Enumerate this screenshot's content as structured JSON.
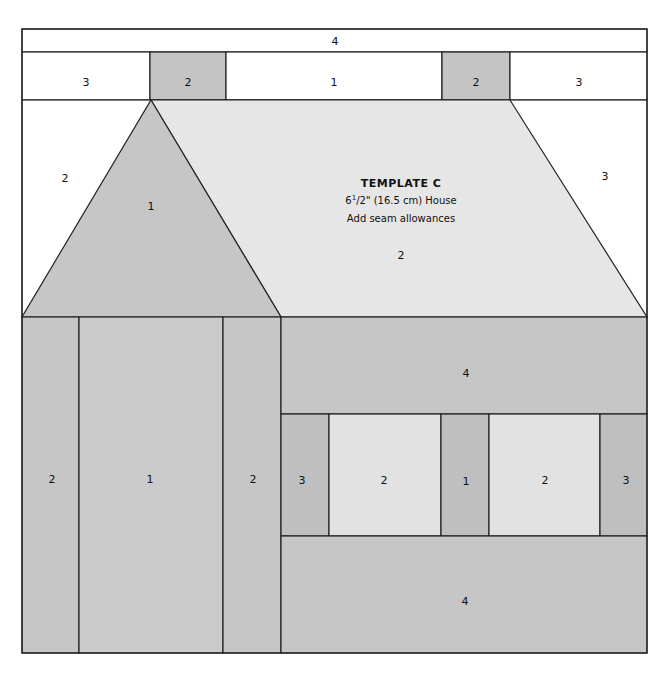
{
  "template": {
    "title": "TEMPLATE C",
    "size_whole": "6",
    "size_frac_num": "1",
    "size_frac_den": "/2",
    "size_rest": "\" (16.5 cm) House",
    "note": "Add seam allowances"
  },
  "colors": {
    "white": "#ffffff",
    "light": "#e3e3e3",
    "medium": "#c8c8c8",
    "dark": "#bdbdbd",
    "line": "#222222"
  },
  "labels": {
    "top_strip": "4",
    "chimney_left_space": "3",
    "chimney_left": "2",
    "chimney_mid_space": "1",
    "chimney_right": "2",
    "chimney_right_space": "3",
    "sky_left": "2",
    "gable": "1",
    "roof": "2",
    "sky_right": "3",
    "door_left_strip": "2",
    "door": "1",
    "door_right_strip": "2",
    "wall_top": "4",
    "window_left_side": "3",
    "window_left": "2",
    "window_divider": "1",
    "window_right": "2",
    "window_right_side": "3",
    "wall_bottom": "4"
  }
}
